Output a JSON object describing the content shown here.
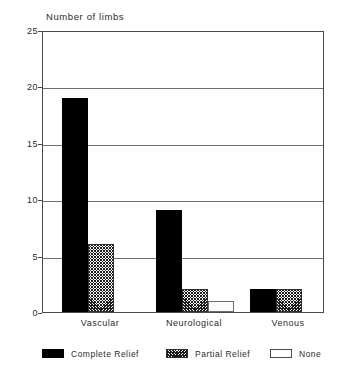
{
  "chart_data": {
    "type": "bar",
    "title": "Number of limbs",
    "xlabel": "",
    "ylabel": "",
    "ylim": [
      0,
      25
    ],
    "ytick_labels": [
      "0",
      "5",
      "10",
      "15",
      "20",
      "25"
    ],
    "ytick_values": [
      0,
      5,
      10,
      15,
      20,
      25
    ],
    "grid": true,
    "legend_position": "bottom",
    "categories": [
      "Vascular",
      "Neurological",
      "Venous"
    ],
    "series": [
      {
        "name": "Complete Relief",
        "pattern": "solid",
        "values": [
          19,
          9,
          2
        ]
      },
      {
        "name": "Partial Relief",
        "pattern": "hatch",
        "values": [
          6,
          2,
          2
        ]
      },
      {
        "name": "None",
        "pattern": "none",
        "values": [
          0,
          1,
          0
        ]
      }
    ]
  },
  "legend": {
    "items": [
      {
        "label": "Complete Relief",
        "pattern": "solid"
      },
      {
        "label": "Partial Relief",
        "pattern": "hatch"
      },
      {
        "label": "None",
        "pattern": "none"
      }
    ]
  }
}
